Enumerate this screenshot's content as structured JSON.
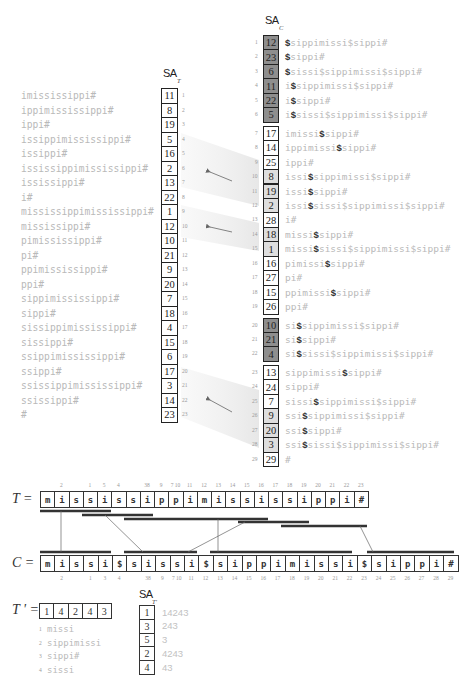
{
  "sa_t": {
    "label": "SA",
    "subscript": "T",
    "rows": [
      {
        "index": "1",
        "value": "11",
        "suffix": "imississippi#"
      },
      {
        "index": "2",
        "value": "8",
        "suffix": "ippimississippi#"
      },
      {
        "index": "3",
        "value": "19",
        "suffix": "ippi#"
      },
      {
        "index": "4",
        "value": "5",
        "suffix": "issippimississippi#"
      },
      {
        "index": "5",
        "value": "16",
        "suffix": "issippi#"
      },
      {
        "index": "6",
        "value": "2",
        "suffix": "ississippimississippi#"
      },
      {
        "index": "7",
        "value": "13",
        "suffix": "ississippi#"
      },
      {
        "index": "8",
        "value": "22",
        "suffix": "i#"
      },
      {
        "index": "9",
        "value": "1",
        "suffix": "mississippimississippi#"
      },
      {
        "index": "10",
        "value": "12",
        "suffix": "mississippi#"
      },
      {
        "index": "11",
        "value": "10",
        "suffix": "pimississippi#"
      },
      {
        "index": "12",
        "value": "21",
        "suffix": "pi#"
      },
      {
        "index": "13",
        "value": "9",
        "suffix": "ppimississippi#"
      },
      {
        "index": "14",
        "value": "20",
        "suffix": "ppi#"
      },
      {
        "index": "15",
        "value": "7",
        "suffix": "sippimississippi#"
      },
      {
        "index": "16",
        "value": "18",
        "suffix": "sippi#"
      },
      {
        "index": "17",
        "value": "4",
        "suffix": "sissippimississippi#"
      },
      {
        "index": "18",
        "value": "15",
        "suffix": "sissippi#"
      },
      {
        "index": "19",
        "value": "6",
        "suffix": "ssippimississippi#"
      },
      {
        "index": "20",
        "value": "17",
        "suffix": "ssippi#"
      },
      {
        "index": "21",
        "value": "3",
        "suffix": "ssissippimississippi#"
      },
      {
        "index": "22",
        "value": "14",
        "suffix": "ssissippi#"
      },
      {
        "index": "23",
        "value": "23",
        "suffix": "#"
      }
    ]
  },
  "sa_c": {
    "label": "SA",
    "subscript": "C",
    "rows": [
      {
        "index": "1",
        "value": "12",
        "shade": "dark",
        "pre": "",
        "dollar": "$",
        "post": "sippimissi$sippi#"
      },
      {
        "index": "2",
        "value": "23",
        "shade": "dark",
        "pre": "",
        "dollar": "$",
        "post": "sippi#"
      },
      {
        "index": "3",
        "value": "6",
        "shade": "dark",
        "pre": "",
        "dollar": "$",
        "post": "sissi$sippimissi$sippi#"
      },
      {
        "index": "4",
        "value": "11",
        "shade": "dark",
        "pre": "i",
        "dollar": "$",
        "post": "sippimissi$sippi#"
      },
      {
        "index": "5",
        "value": "22",
        "shade": "dark",
        "pre": "i",
        "dollar": "$",
        "post": "sippi#"
      },
      {
        "index": "6",
        "value": "5",
        "shade": "dark",
        "pre": "i",
        "dollar": "$",
        "post": "sissi$sippimissi$sippi#"
      },
      {
        "index": "7",
        "value": "17",
        "shade": "none",
        "pre": "imissi",
        "dollar": "$",
        "post": "sippi#"
      },
      {
        "index": "8",
        "value": "14",
        "shade": "none",
        "pre": "ippimissi",
        "dollar": "$",
        "post": "sippi#"
      },
      {
        "index": "9",
        "value": "25",
        "shade": "none",
        "pre": "ippi#",
        "dollar": "",
        "post": ""
      },
      {
        "index": "10",
        "value": "8",
        "shade": "light",
        "pre": "issi",
        "dollar": "$",
        "post": "sippimissi$sippi#"
      },
      {
        "index": "11",
        "value": "19",
        "shade": "light",
        "pre": "issi",
        "dollar": "$",
        "post": "sippi#"
      },
      {
        "index": "12",
        "value": "2",
        "shade": "light",
        "pre": "issi",
        "dollar": "$",
        "post": "sissi$sippimissi$sippi#"
      },
      {
        "index": "13",
        "value": "28",
        "shade": "none",
        "pre": "i#",
        "dollar": "",
        "post": ""
      },
      {
        "index": "14",
        "value": "18",
        "shade": "light",
        "pre": "missi",
        "dollar": "$",
        "post": "sippi#"
      },
      {
        "index": "15",
        "value": "1",
        "shade": "light",
        "pre": "missi",
        "dollar": "$",
        "post": "sissi$sippimissi$sippi#"
      },
      {
        "index": "16",
        "value": "16",
        "shade": "none",
        "pre": "pimissi",
        "dollar": "$",
        "post": "sippi#"
      },
      {
        "index": "17",
        "value": "27",
        "shade": "none",
        "pre": "pi#",
        "dollar": "",
        "post": ""
      },
      {
        "index": "18",
        "value": "15",
        "shade": "none",
        "pre": "ppimissi",
        "dollar": "$",
        "post": "sippi#"
      },
      {
        "index": "19",
        "value": "26",
        "shade": "none",
        "pre": "ppi#",
        "dollar": "",
        "post": ""
      },
      {
        "index": "20",
        "value": "10",
        "shade": "dark",
        "pre": "si",
        "dollar": "$",
        "post": "sippimissi$sippi#"
      },
      {
        "index": "21",
        "value": "21",
        "shade": "dark",
        "pre": "si",
        "dollar": "$",
        "post": "sippi#"
      },
      {
        "index": "22",
        "value": "4",
        "shade": "dark",
        "pre": "si",
        "dollar": "$",
        "post": "sissi$sippimissi$sippi#"
      },
      {
        "index": "23",
        "value": "13",
        "shade": "none",
        "pre": "sippimissi",
        "dollar": "$",
        "post": "sippi#"
      },
      {
        "index": "24",
        "value": "24",
        "shade": "none",
        "pre": "sippi#",
        "dollar": "",
        "post": ""
      },
      {
        "index": "25",
        "value": "7",
        "shade": "none",
        "pre": "sissi",
        "dollar": "$",
        "post": "sippimissi$sippi#"
      },
      {
        "index": "26",
        "value": "9",
        "shade": "light",
        "pre": "ssi",
        "dollar": "$",
        "post": "sippimissi$sippi#"
      },
      {
        "index": "27",
        "value": "20",
        "shade": "light",
        "pre": "ssi",
        "dollar": "$",
        "post": "sippi#"
      },
      {
        "index": "28",
        "value": "3",
        "shade": "light",
        "pre": "ssi",
        "dollar": "$",
        "post": "sissi$sippimissi$sippi#"
      },
      {
        "index": "29",
        "value": "29",
        "shade": "none",
        "pre": "#",
        "dollar": "",
        "post": ""
      }
    ]
  },
  "t_row": {
    "label": "T =",
    "chars": [
      "m",
      "i",
      "s",
      "s",
      "i",
      "s",
      "s",
      "i",
      "p",
      "p",
      "i",
      "m",
      "i",
      "s",
      "s",
      "i",
      "s",
      "s",
      "i",
      "p",
      "p",
      "i",
      "#"
    ],
    "top_labels": [
      "",
      "2",
      "",
      "1",
      "5",
      "4",
      "",
      "38",
      "9",
      "7 10",
      "11",
      "12",
      "13",
      "14",
      "15",
      "16",
      "17",
      "18",
      "19",
      "20",
      "21",
      "22",
      "23"
    ]
  },
  "c_row": {
    "label": "C =",
    "chars": [
      "m",
      "i",
      "s",
      "s",
      "i",
      "$",
      "s",
      "i",
      "s",
      "s",
      "i",
      "$",
      "s",
      "i",
      "p",
      "p",
      "i",
      "m",
      "i",
      "s",
      "s",
      "i",
      "$",
      "s",
      "i",
      "p",
      "p",
      "i",
      "#"
    ],
    "bottom_labels": [
      "",
      "2",
      "",
      "1",
      "3",
      "4",
      "",
      "38",
      "9",
      "7 10",
      "11",
      "12",
      "13",
      "14",
      "15",
      "16",
      "17",
      "18",
      "19",
      "20",
      "21",
      "22",
      "23",
      "24",
      "25",
      "26",
      "27",
      "28",
      "29"
    ]
  },
  "t_prime": {
    "label": "T ' =",
    "values": [
      "1",
      "4",
      "2",
      "4",
      "3"
    ],
    "dictionary": [
      {
        "num": "1",
        "word": "missi"
      },
      {
        "num": "2",
        "word": "sippimissi"
      },
      {
        "num": "3",
        "word": "sippi#"
      },
      {
        "num": "4",
        "word": "sissi"
      }
    ]
  },
  "sa_tp": {
    "label": "SA",
    "subscript": "T'",
    "rows": [
      {
        "value": "1",
        "suffix": "14243"
      },
      {
        "value": "3",
        "suffix": "243"
      },
      {
        "value": "5",
        "suffix": "3"
      },
      {
        "value": "2",
        "suffix": "4243"
      },
      {
        "value": "4",
        "suffix": "43"
      }
    ]
  },
  "colors": {
    "dark_cell": "#8e8e8e",
    "light_cell": "#dedede",
    "suffix_text": "#b9b9b9",
    "dollar": "#333333",
    "bar": "#333333"
  }
}
